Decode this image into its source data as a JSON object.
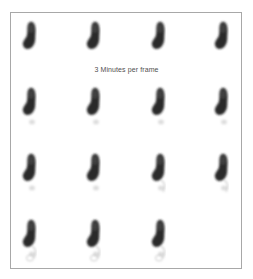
{
  "figure": {
    "caption": "3 Minutes per frame",
    "frame_count": 15,
    "grid": {
      "columns": 4,
      "rows": 4
    },
    "border_color": "#a8a8a8",
    "frames": [
      {
        "index": 1,
        "row": 0,
        "col": 0,
        "tail": 0
      },
      {
        "index": 2,
        "row": 0,
        "col": 1,
        "tail": 0
      },
      {
        "index": 3,
        "row": 0,
        "col": 2,
        "tail": 0
      },
      {
        "index": 4,
        "row": 0,
        "col": 3,
        "tail": 0
      },
      {
        "index": 5,
        "row": 1,
        "col": 0,
        "tail": 1
      },
      {
        "index": 6,
        "row": 1,
        "col": 1,
        "tail": 1
      },
      {
        "index": 7,
        "row": 1,
        "col": 2,
        "tail": 1
      },
      {
        "index": 8,
        "row": 1,
        "col": 3,
        "tail": 1
      },
      {
        "index": 9,
        "row": 2,
        "col": 0,
        "tail": 1
      },
      {
        "index": 10,
        "row": 2,
        "col": 1,
        "tail": 1
      },
      {
        "index": 11,
        "row": 2,
        "col": 2,
        "tail": 2
      },
      {
        "index": 12,
        "row": 2,
        "col": 3,
        "tail": 2
      },
      {
        "index": 13,
        "row": 3,
        "col": 0,
        "tail": 3
      },
      {
        "index": 14,
        "row": 3,
        "col": 1,
        "tail": 3
      },
      {
        "index": 15,
        "row": 3,
        "col": 2,
        "tail": 3
      }
    ]
  }
}
